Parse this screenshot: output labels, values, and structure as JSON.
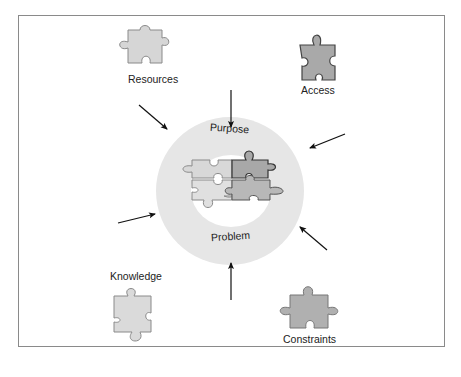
{
  "diagram": {
    "center": {
      "ring_top_label": "Purpose",
      "ring_bottom_label": "Problem",
      "ring_color": "#e6e6e6"
    },
    "pieces": [
      {
        "id": "resources",
        "label": "Resources",
        "fill": "#d6d6d6"
      },
      {
        "id": "access",
        "label": "Access",
        "fill": "#a9a9a9"
      },
      {
        "id": "knowledge",
        "label": "Knowledge",
        "fill": "#dadada"
      },
      {
        "id": "constraints",
        "label": "Constraints",
        "fill": "#b0b0b0"
      }
    ],
    "arrows": [
      {
        "from": "top",
        "direction": "down"
      },
      {
        "from": "top-left",
        "direction": "down-right"
      },
      {
        "from": "top-right",
        "direction": "down-left"
      },
      {
        "from": "left",
        "direction": "right"
      },
      {
        "from": "bottom",
        "direction": "up"
      },
      {
        "from": "bottom-right",
        "direction": "up-left"
      }
    ]
  }
}
